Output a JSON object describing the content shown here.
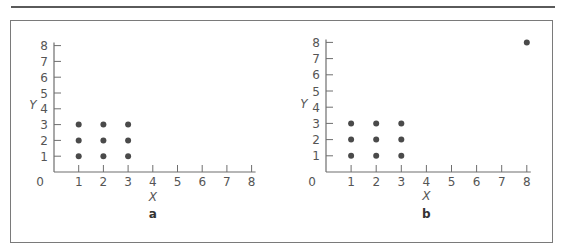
{
  "chart_data": [
    {
      "type": "scatter",
      "panel_label": "a",
      "xlabel": "X",
      "ylabel": "Y",
      "xlim": [
        0,
        8
      ],
      "ylim": [
        0,
        8
      ],
      "x_ticks": [
        1,
        2,
        3,
        4,
        5,
        6,
        7,
        8
      ],
      "y_ticks": [
        1,
        2,
        3,
        4,
        5,
        6,
        7,
        8
      ],
      "origin_label": "0",
      "grid": false,
      "points": [
        {
          "x": 1,
          "y": 1
        },
        {
          "x": 2,
          "y": 1
        },
        {
          "x": 3,
          "y": 1
        },
        {
          "x": 1,
          "y": 2
        },
        {
          "x": 2,
          "y": 2
        },
        {
          "x": 3,
          "y": 2
        },
        {
          "x": 1,
          "y": 3
        },
        {
          "x": 2,
          "y": 3
        },
        {
          "x": 3,
          "y": 3
        }
      ],
      "layout": {
        "ox": 54,
        "oy": 172,
        "dx": 24.7,
        "dy": 15.8,
        "xlabel_y": 201,
        "panel_label_y": 218,
        "ylabel_x": 33,
        "ylabel_y": 109
      }
    },
    {
      "type": "scatter",
      "panel_label": "b",
      "xlabel": "X",
      "ylabel": "Y",
      "xlim": [
        0,
        8
      ],
      "ylim": [
        0,
        8
      ],
      "x_ticks": [
        1,
        2,
        3,
        4,
        5,
        6,
        7,
        8
      ],
      "y_ticks": [
        1,
        2,
        3,
        4,
        5,
        6,
        7,
        8
      ],
      "origin_label": "0",
      "grid": false,
      "points": [
        {
          "x": 1,
          "y": 1
        },
        {
          "x": 2,
          "y": 1
        },
        {
          "x": 3,
          "y": 1
        },
        {
          "x": 1,
          "y": 2
        },
        {
          "x": 2,
          "y": 2
        },
        {
          "x": 3,
          "y": 2
        },
        {
          "x": 1,
          "y": 3
        },
        {
          "x": 2,
          "y": 3
        },
        {
          "x": 3,
          "y": 3
        },
        {
          "x": 8,
          "y": 8
        }
      ],
      "layout": {
        "ox": 326,
        "oy": 172,
        "dx": 25.1,
        "dy": 16.2,
        "xlabel_y": 200,
        "panel_label_y": 218,
        "ylabel_x": 304,
        "ylabel_y": 108
      }
    }
  ],
  "colors": {
    "axis": "#6e6e6e",
    "point": "#4a4a4a",
    "frame": "#7a7a7a"
  }
}
